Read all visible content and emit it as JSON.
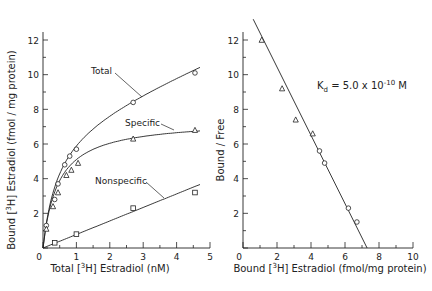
{
  "chart_data": [
    {
      "type": "scatter",
      "title": "",
      "xlabel": "Total [3H] Estradiol (nM)",
      "ylabel": "Bound [3H] Estradiol (fmol / mg protein)",
      "xlim": [
        0,
        5
      ],
      "ylim": [
        0,
        13
      ],
      "x_ticks": [
        "0",
        "1",
        "2",
        "3",
        "4",
        "5"
      ],
      "y_ticks": [
        "2",
        "4",
        "6",
        "8",
        "10",
        "12"
      ],
      "grid": false,
      "series": [
        {
          "name": "Total",
          "marker": "circle",
          "x": [
            0.1,
            0.35,
            0.45,
            0.65,
            0.8,
            1.0,
            2.7,
            4.55
          ],
          "y": [
            1.3,
            2.8,
            3.7,
            4.8,
            5.3,
            5.7,
            8.4,
            10.1
          ]
        },
        {
          "name": "Specific",
          "marker": "triangle",
          "x": [
            0.1,
            0.3,
            0.45,
            0.7,
            0.85,
            1.05,
            2.7,
            4.55
          ],
          "y": [
            1.1,
            2.4,
            3.2,
            4.2,
            4.5,
            4.9,
            6.3,
            6.8
          ]
        },
        {
          "name": "Nonspecific",
          "marker": "square",
          "x": [
            0.35,
            1.0,
            2.7,
            4.55
          ],
          "y": [
            0.3,
            0.8,
            2.3,
            3.2
          ]
        }
      ],
      "annotations": [
        "Total",
        "Specific",
        "Nonspecific"
      ]
    },
    {
      "type": "scatter",
      "title": "",
      "xlabel": "Bound [3H] Estradiol (fmol/mg protein)",
      "ylabel": "Bound / Free",
      "xlim": [
        0,
        10
      ],
      "ylim": [
        0,
        13
      ],
      "x_ticks": [
        "0",
        "2",
        "4",
        "6",
        "8",
        "10"
      ],
      "y_ticks": [
        "2",
        "4",
        "6",
        "8",
        "10",
        "12"
      ],
      "grid": false,
      "series": [
        {
          "name": "Scatchard",
          "marker": "triangle",
          "x": [
            1.1,
            2.3,
            3.1,
            4.1,
            4.5,
            4.8,
            6.2,
            6.7
          ],
          "y": [
            12.0,
            9.2,
            7.4,
            6.6,
            5.6,
            4.9,
            2.3,
            1.5
          ]
        }
      ],
      "fit_line": {
        "x": [
          0.6,
          7.3
        ],
        "y": [
          13.2,
          0
        ]
      },
      "annotations": [
        "Kd = 5.0 x 10^-10 M"
      ]
    }
  ],
  "left": {
    "xlabel_pre": "Total [",
    "xlabel_sup": "3",
    "xlabel_post": "H] Estradiol  (nM)",
    "ylabel_pre": "Bound [",
    "ylabel_sup": "3",
    "ylabel_post": "H] Estradiol  (fmol / mg protein)",
    "label_total": "Total",
    "label_specific": "Specific",
    "label_nonspecific": "Nonspecific"
  },
  "right": {
    "xlabel_pre": "Bound [",
    "xlabel_sup": "3",
    "xlabel_post": "H] Estradiol (fmol/mg protein)",
    "ylabel": "Bound / Free",
    "kd_k": "K",
    "kd_sub": "d",
    "kd_mid": " = 5.0 x 10",
    "kd_exp": "-10",
    "kd_unit": " M"
  }
}
